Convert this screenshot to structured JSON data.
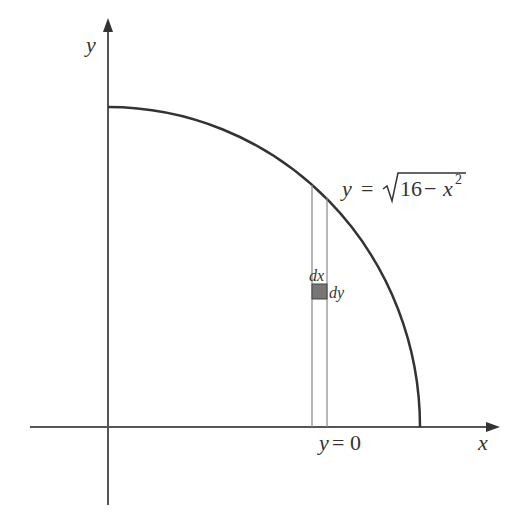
{
  "figure": {
    "type": "quarter-circle region with integration element",
    "axes": {
      "x_label": "x",
      "y_label": "y"
    },
    "curve": {
      "equation_lhs": "y",
      "equation_eq": "=",
      "equation_radicand_num": "16",
      "equation_minus": "−",
      "equation_var": "x",
      "equation_exp": "2",
      "equation_text": "y = √(16 − x²)"
    },
    "element": {
      "dx_label": "dx",
      "dy_label": "dy",
      "fill_color": "#777777"
    },
    "lower_bound_label": "y = 0",
    "colors": {
      "stroke": "#333333",
      "axis": "#555555",
      "strip": "#888888"
    }
  }
}
